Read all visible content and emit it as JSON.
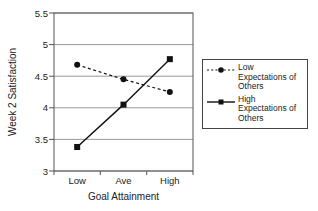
{
  "chart_data": {
    "type": "line",
    "title": "",
    "xlabel": "Goal Attainment",
    "ylabel": "Week 2 Satisfaction",
    "categories": [
      "Low",
      "Ave",
      "High"
    ],
    "series": [
      {
        "name": "Low Expectations of Others",
        "values": [
          4.68,
          4.45,
          4.25
        ],
        "line": "dashed",
        "marker": "circle",
        "color": "#111111"
      },
      {
        "name": "High Expectations of Others",
        "values": [
          3.38,
          4.05,
          4.77
        ],
        "line": "solid",
        "marker": "square",
        "color": "#111111"
      }
    ],
    "ylim": [
      3,
      5.5
    ],
    "yticks": [
      3,
      3.5,
      4,
      4.5,
      5,
      5.5
    ],
    "ytick_labels": [
      "3",
      "3.5",
      "4",
      "4.5",
      "5",
      "5.5"
    ],
    "grid": "horizontal",
    "legend_position": "right-outside",
    "colors": {
      "series": "#111111",
      "gridline": "#999999",
      "plot_border": "#555555",
      "background": "#ffffff"
    }
  }
}
